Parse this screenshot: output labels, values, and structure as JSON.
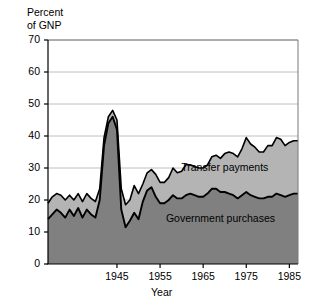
{
  "chart_data": {
    "type": "area",
    "title": "",
    "subtitle": "",
    "ylabel": "Percent\nof GNP",
    "ylabel_line1": "Percent",
    "ylabel_line2": "of GNP",
    "xlabel": "Year",
    "ylim": [
      0,
      70
    ],
    "xlim": [
      1929,
      1987
    ],
    "ytick_labels": [
      "70",
      "60",
      "50",
      "40",
      "30",
      "20",
      "10",
      "0"
    ],
    "ytick_values": [
      70,
      60,
      50,
      40,
      30,
      20,
      10,
      0
    ],
    "xtick_labels": [
      "1945",
      "1955",
      "1965",
      "1975",
      "1985"
    ],
    "xtick_values": [
      1945,
      1955,
      1965,
      1975,
      1985
    ],
    "grid": "horizontal",
    "legend_position": "inline-annotation",
    "stacked": true,
    "colors": {
      "government_purchases": "#808080",
      "transfer_payments": "#b4b4b4",
      "outline": "#000000",
      "gridline": "#b0b0b0",
      "background": "#ffffff"
    },
    "annotations": [
      {
        "text": "Transfer payments",
        "x": 1970,
        "y": 30
      },
      {
        "text": "Government purchases",
        "x": 1969,
        "y": 14
      }
    ],
    "x": [
      1929,
      1930,
      1931,
      1932,
      1933,
      1934,
      1935,
      1936,
      1937,
      1938,
      1939,
      1940,
      1941,
      1942,
      1943,
      1944,
      1945,
      1946,
      1947,
      1948,
      1949,
      1950,
      1951,
      1952,
      1953,
      1954,
      1955,
      1956,
      1957,
      1958,
      1959,
      1960,
      1961,
      1962,
      1963,
      1964,
      1965,
      1966,
      1967,
      1968,
      1969,
      1970,
      1971,
      1972,
      1973,
      1974,
      1975,
      1976,
      1977,
      1978,
      1979,
      1980,
      1981,
      1982,
      1983,
      1984,
      1985,
      1986,
      1987
    ],
    "series": [
      {
        "name": "Government purchases",
        "values": [
          14.0,
          15.5,
          17.0,
          16.0,
          14.5,
          17.0,
          15.0,
          17.5,
          14.5,
          17.0,
          15.5,
          14.5,
          20.0,
          37.0,
          44.0,
          46.0,
          42.0,
          17.0,
          11.5,
          13.5,
          16.0,
          14.0,
          19.5,
          23.0,
          24.0,
          21.0,
          19.0,
          19.0,
          20.0,
          21.5,
          20.5,
          20.5,
          21.5,
          22.0,
          21.5,
          21.0,
          21.0,
          22.0,
          23.5,
          23.5,
          22.5,
          22.5,
          22.0,
          21.5,
          20.5,
          21.5,
          22.5,
          21.5,
          21.0,
          20.5,
          20.5,
          21.0,
          21.0,
          22.0,
          21.5,
          21.0,
          21.5,
          22.0,
          22.0
        ]
      },
      {
        "name": "Transfer payments",
        "values": [
          5.0,
          5.5,
          5.0,
          5.5,
          5.5,
          4.5,
          5.0,
          4.5,
          5.0,
          5.0,
          5.0,
          5.0,
          3.5,
          2.5,
          2.0,
          2.0,
          3.0,
          6.5,
          7.0,
          6.5,
          8.5,
          8.0,
          5.5,
          5.5,
          5.5,
          7.0,
          6.5,
          6.5,
          7.0,
          8.5,
          8.0,
          8.5,
          9.5,
          9.0,
          9.0,
          9.0,
          9.0,
          9.0,
          10.0,
          10.5,
          10.5,
          12.0,
          13.0,
          13.0,
          13.0,
          14.5,
          17.0,
          16.0,
          15.5,
          14.5,
          14.5,
          16.0,
          16.0,
          17.5,
          17.5,
          16.0,
          16.5,
          16.5,
          16.5
        ]
      }
    ],
    "total_values": [
      19.0,
      21.0,
      22.0,
      21.5,
      20.0,
      21.5,
      20.0,
      22.0,
      19.5,
      22.0,
      20.5,
      19.5,
      23.5,
      39.5,
      46.0,
      48.0,
      45.0,
      23.5,
      18.5,
      20.0,
      24.5,
      22.0,
      25.0,
      28.5,
      29.5,
      28.0,
      25.5,
      25.5,
      27.0,
      30.0,
      28.5,
      29.0,
      31.0,
      31.0,
      30.5,
      30.0,
      30.0,
      31.0,
      33.5,
      34.0,
      33.0,
      34.5,
      35.0,
      34.5,
      33.5,
      36.0,
      39.5,
      37.5,
      36.5,
      35.0,
      35.0,
      37.0,
      37.0,
      39.5,
      39.0,
      37.0,
      38.0,
      38.5,
      38.5
    ]
  }
}
